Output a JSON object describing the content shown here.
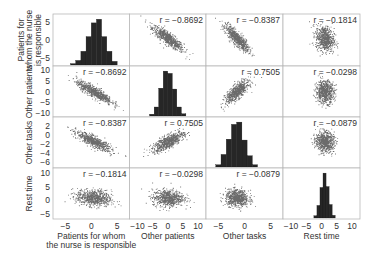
{
  "chart_data": {
    "type": "scatter",
    "subtype": "scatter_matrix",
    "title": "",
    "variables": [
      "Patients for whom the nurse is responsible",
      "Other patients",
      "Other tasks",
      "Rest time"
    ],
    "row_labels": [
      [
        "Patients for",
        "whom the nurse",
        "is responsible"
      ],
      [
        "Other patients"
      ],
      [
        "Other tasks"
      ],
      [
        "Rest time"
      ]
    ],
    "column_labels": [
      [
        "Patients for whom",
        "the nurse is responsible"
      ],
      [
        "Other patients"
      ],
      [
        "Other tasks"
      ],
      [
        "Rest time"
      ]
    ],
    "axis_ranges": [
      [
        -7,
        7
      ],
      [
        -12,
        12
      ],
      [
        -7,
        7
      ],
      [
        -12,
        12
      ]
    ],
    "y_axis_ranges": [
      [
        -6.5,
        6.5
      ],
      [
        -11,
        11
      ],
      [
        -7,
        3.5
      ],
      [
        -6,
        11
      ]
    ],
    "x_ticks": [
      [
        -5,
        0,
        5
      ],
      [
        -10,
        -5,
        0,
        5,
        10
      ],
      [
        -5,
        0,
        5
      ],
      [
        -10,
        -5,
        0,
        5,
        10
      ]
    ],
    "y_ticks": [
      [
        -5,
        0,
        5
      ],
      [
        -10,
        -5,
        0,
        5,
        10
      ],
      [
        -6,
        -4,
        -2,
        0,
        2
      ],
      [
        -5,
        0,
        5,
        10
      ]
    ],
    "means": [
      0.5,
      0.0,
      -1.5,
      1.0
    ],
    "std_devs": [
      1.7,
      2.6,
      1.1,
      1.5
    ],
    "correlations": [
      [
        1,
        -0.8692,
        -0.8387,
        -0.1814
      ],
      [
        -0.8692,
        1,
        0.7505,
        -0.0298
      ],
      [
        -0.8387,
        0.7505,
        1,
        -0.0879
      ],
      [
        -0.1814,
        -0.0298,
        -0.0879,
        1
      ]
    ],
    "correlation_labels": [
      [
        "",
        "r = −0.8692",
        "r = −0.8387",
        "r = −0.1814"
      ],
      [
        "r = −0.8692",
        "",
        "r = 0.7505",
        "r = −0.0298"
      ],
      [
        "r = −0.8387",
        "r = 0.7505",
        "",
        "r = −0.0879"
      ],
      [
        "r = −0.1814",
        "r = −0.0298",
        "r = −0.0879",
        ""
      ]
    ],
    "histograms": [
      {
        "variable": "Patients for whom the nurse is responsible",
        "bin_edges": [
          -4,
          -3,
          -2,
          -1,
          0,
          1,
          2,
          3,
          4,
          5
        ],
        "relative_heights": [
          0.03,
          0.1,
          0.3,
          0.62,
          0.92,
          1.0,
          0.62,
          0.3,
          0.08
        ]
      },
      {
        "variable": "Other patients",
        "bin_edges": [
          -6,
          -4.5,
          -3,
          -1.5,
          0,
          1.5,
          3,
          4.5,
          6
        ],
        "relative_heights": [
          0.04,
          0.2,
          0.62,
          1.0,
          0.95,
          0.6,
          0.2,
          0.05
        ]
      },
      {
        "variable": "Other tasks",
        "bin_edges": [
          -5.5,
          -4.5,
          -3.5,
          -2.5,
          -1.5,
          -0.5,
          0.5,
          1.5,
          2.5
        ],
        "relative_heights": [
          0.05,
          0.28,
          0.62,
          0.95,
          1.0,
          0.6,
          0.25,
          0.05
        ]
      },
      {
        "variable": "Rest time",
        "bin_edges": [
          -2.5,
          -1.5,
          -0.5,
          0.5,
          1.5,
          2.5,
          3.5,
          4.5
        ],
        "relative_heights": [
          0.05,
          0.28,
          0.68,
          1.0,
          0.7,
          0.3,
          0.06
        ]
      }
    ],
    "grid": false,
    "legend": null,
    "colors": {
      "points": "#3a3a3a",
      "bars": "#262626",
      "frame": "#b8b8b8",
      "text": "#333333"
    },
    "points_per_panel": 700
  }
}
